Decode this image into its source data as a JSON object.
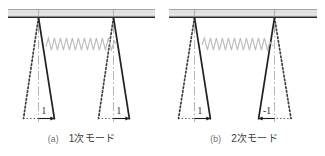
{
  "figure": {
    "title": "",
    "background_color": "#ffffff",
    "line_color": "#2b2b2b",
    "spring_color": "#b9b9b9",
    "beam_fill": "#e2e2e2",
    "beam_edge": "#3a3a3a",
    "centerline_color": "#9a9a9a",
    "dotted_color": "#4a4a4a"
  },
  "panels": [
    {
      "id": "panel-a",
      "tag": "(a)",
      "label": "1次モード",
      "mode_number": 1,
      "legs": [
        {
          "name": "left-leg",
          "amplitude_label": "1",
          "direction": "right"
        },
        {
          "name": "right-leg",
          "amplitude_label": "1",
          "direction": "right"
        }
      ],
      "spring": {
        "name": "coupling-spring",
        "coils": 14
      }
    },
    {
      "id": "panel-b",
      "tag": "(b)",
      "label": "2次モード",
      "mode_number": 2,
      "legs": [
        {
          "name": "left-leg",
          "amplitude_label": "1",
          "direction": "right"
        },
        {
          "name": "right-leg",
          "amplitude_label": "-1",
          "direction": "left"
        }
      ],
      "spring": {
        "name": "coupling-spring",
        "coils": 14
      }
    }
  ],
  "icons": {
    "beam": "hatched-beam-icon",
    "spring": "zigzag-spring-icon",
    "arrow": "arrow-icon",
    "centerline": "dash-dot-centerline-icon"
  }
}
